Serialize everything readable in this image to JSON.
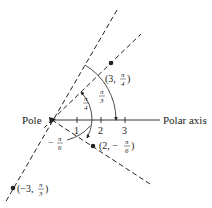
{
  "diagram": {
    "type": "polar-coordinates",
    "pole_label": "Pole",
    "axis_label": "Polar axis",
    "ticks": [
      "1",
      "2",
      "3"
    ],
    "colors": {
      "ink": "#222222",
      "background": "#ffffff"
    },
    "rays": [
      {
        "name": "ray-pi-over-3",
        "angle": "π/3",
        "style": "dashed"
      },
      {
        "name": "ray-pi-over-4",
        "angle": "π/4",
        "style": "dashed"
      },
      {
        "name": "ray-minus-pi-over-6",
        "angle": "−π/6",
        "style": "dashed"
      }
    ],
    "angle_labels": {
      "pi_over_4": {
        "num": "π",
        "den": "4"
      },
      "pi_over_3": {
        "num": "π",
        "den": "3"
      },
      "minus_pi_over_6": {
        "sign": "−",
        "num": "π",
        "den": "6"
      }
    },
    "points": [
      {
        "label_prefix": "(3,",
        "num": "π",
        "den": "4",
        "label_suffix": ")",
        "r": 3,
        "theta": "π/4"
      },
      {
        "label_prefix": "(2, −",
        "num": "π",
        "den": "6",
        "label_suffix": ")",
        "r": 2,
        "theta": "−π/6"
      },
      {
        "label_prefix": "(−3,",
        "num": "π",
        "den": "3",
        "label_suffix": ")",
        "r": -3,
        "theta": "π/3"
      }
    ]
  }
}
